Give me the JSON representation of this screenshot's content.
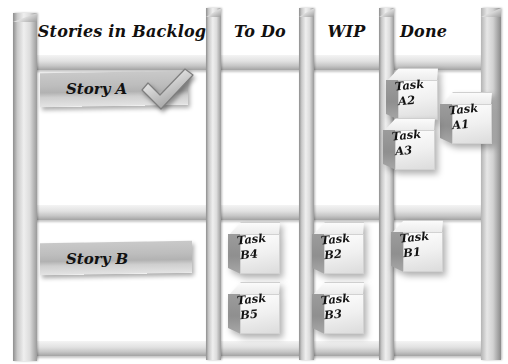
{
  "board": {
    "title": "Scrum Task Board",
    "columns": [
      {
        "id": "backlog",
        "label": "Stories in Backlog"
      },
      {
        "id": "todo",
        "label": "To Do"
      },
      {
        "id": "wip",
        "label": "WIP"
      },
      {
        "id": "done",
        "label": "Done"
      }
    ],
    "rows": [
      {
        "story": {
          "label": "Story A",
          "done": true,
          "check_icon": "check-icon"
        },
        "todo": [],
        "wip": [],
        "done": [
          {
            "line1": "Task",
            "line2": "A2"
          },
          {
            "line1": "Task",
            "line2": "A1"
          },
          {
            "line1": "Task",
            "line2": "A3"
          }
        ]
      },
      {
        "story": {
          "label": "Story B",
          "done": false,
          "check_icon": ""
        },
        "todo": [
          {
            "line1": "Task",
            "line2": "B4"
          },
          {
            "line1": "Task",
            "line2": "B5"
          }
        ],
        "wip": [
          {
            "line1": "Task",
            "line2": "B2"
          },
          {
            "line1": "Task",
            "line2": "B3"
          }
        ],
        "done": [
          {
            "line1": "Task",
            "line2": "B1"
          }
        ]
      }
    ],
    "colors": {
      "frame": "#c9c9c9",
      "rail": "#e2e2e2",
      "story_card": "#bdbdbd",
      "cube_front": "#f0f0f0",
      "cube_side": "#8f8f8f",
      "ink": "#121212",
      "background": "#ffffff"
    }
  }
}
